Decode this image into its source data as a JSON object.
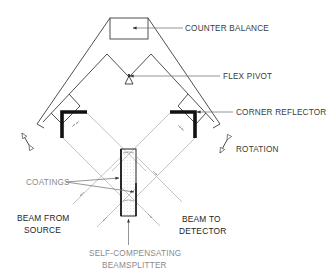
{
  "diagram": {
    "type": "interferometer-schematic",
    "labels": {
      "counter_balance": "COUNTER BALANCE",
      "flex_pivot": "FLEX PIVOT",
      "corner_reflector": "CORNER REFLECTOR",
      "rotation": "ROTATION",
      "coatings": "COATINGS",
      "beam_from_source_line1": "BEAM FROM",
      "beam_from_source_line2": "SOURCE",
      "beam_to_detector_line1": "BEAM TO",
      "beam_to_detector_line2": "DETECTOR",
      "beamsplitter_line1": "SELF-COMPENSATING",
      "beamsplitter_line2": "BEAMSPLITTER"
    },
    "components": [
      {
        "id": "counter-balance",
        "label": "COUNTER BALANCE"
      },
      {
        "id": "flex-pivot",
        "label": "FLEX PIVOT"
      },
      {
        "id": "corner-reflector-left",
        "label": "CORNER REFLECTOR"
      },
      {
        "id": "corner-reflector-right",
        "label": "CORNER REFLECTOR"
      },
      {
        "id": "beamsplitter",
        "label": "SELF-COMPENSATING BEAMSPLITTER"
      }
    ],
    "colors": {
      "frame": "#3c3c3c",
      "beam": "#b5b5b5",
      "reflector": "#111111",
      "background": "#ffffff"
    }
  }
}
